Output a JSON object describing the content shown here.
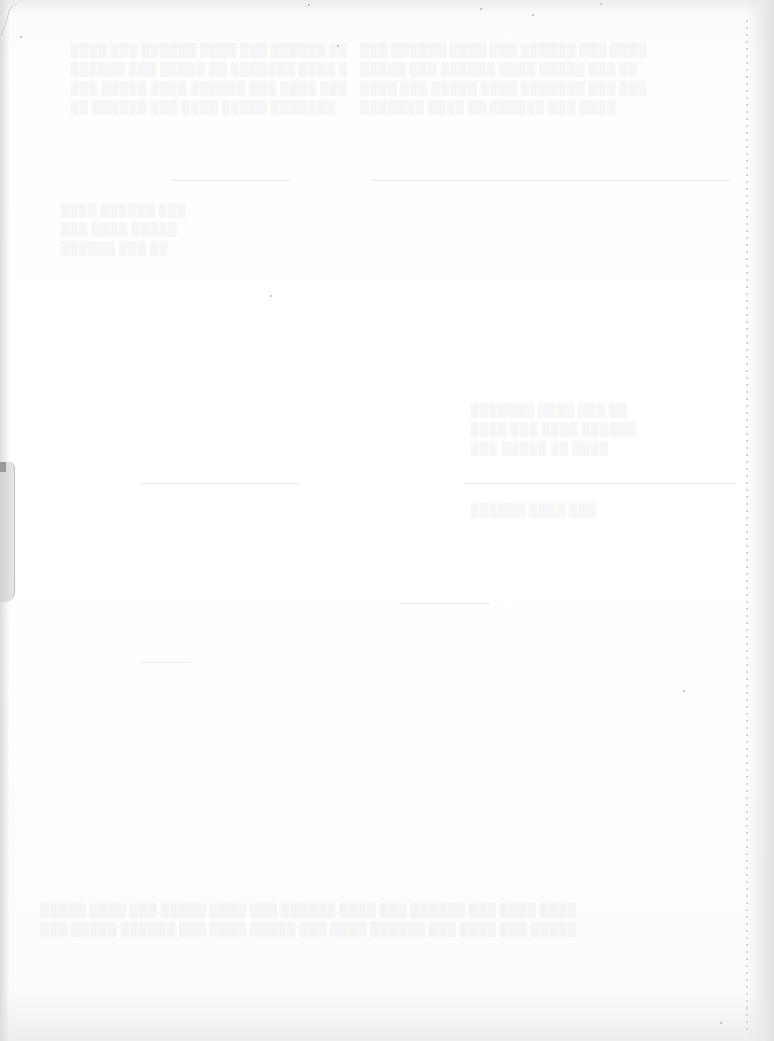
{
  "document": {
    "type": "scanned-blank-page",
    "legible_text": "",
    "description": "Nearly blank scanned paper page with faint illegible show-through from reverse side",
    "colors": {
      "paper": "#ffffff",
      "edge_shadow": "#dcdcdc",
      "perforation": "#c8c8c8"
    },
    "faint_rules_y": [
      180,
      483,
      603
    ],
    "features": [
      "perforated-right-edge",
      "curled-left-edge",
      "bleed-through-text"
    ]
  }
}
